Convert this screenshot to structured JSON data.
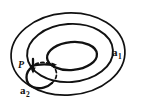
{
  "figure": {
    "kind": "topology-diagram",
    "background_color": "#ffffff",
    "stroke_color": "#111111",
    "width": 144,
    "height": 108,
    "labels": {
      "base_point": "P",
      "loop_outer_base": "a",
      "loop_outer_subscript": "1",
      "loop_inner_base": "a",
      "loop_inner_subscript": "2"
    },
    "curves": [
      {
        "name": "outer-boundary-ellipse",
        "type": "ellipse",
        "cx": 68,
        "cy": 54,
        "rx": 57,
        "ry": 41,
        "rotation": -4,
        "style": "solid"
      },
      {
        "name": "middle-ellipse",
        "type": "ellipse",
        "cx": 70,
        "cy": 53,
        "rx": 43,
        "ry": 29,
        "rotation": -4,
        "style": "solid"
      },
      {
        "name": "inner-ellipse",
        "type": "ellipse",
        "cx": 72,
        "cy": 56,
        "rx": 25,
        "ry": 14,
        "rotation": -5,
        "style": "solid"
      },
      {
        "name": "loop-a2-solid-arc",
        "type": "arc",
        "style": "solid",
        "note": "small loop from P looping down and back, generator a2"
      },
      {
        "name": "loop-a2-dashed-arc",
        "type": "arc",
        "style": "dashed",
        "note": "hidden part of the a2 loop behind the surface"
      }
    ],
    "arrows": [
      {
        "name": "arrow-at-base-point",
        "direction": "down",
        "at": "P"
      },
      {
        "name": "arrow-on-inner-loop",
        "direction": "right",
        "at": "inner-ellipse-left"
      }
    ]
  }
}
